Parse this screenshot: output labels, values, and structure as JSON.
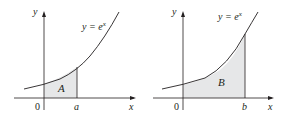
{
  "figures": [
    {
      "id": "left",
      "curve_label": "y = e",
      "curve_exponent": "x",
      "y_axis_label": "y",
      "x_axis_label": "x",
      "origin_label": "0",
      "bound_label": "a",
      "region_label": "A"
    },
    {
      "id": "right",
      "curve_label": "y = e",
      "curve_exponent": "x",
      "y_axis_label": "y",
      "x_axis_label": "x",
      "origin_label": "0",
      "bound_label": "b",
      "region_label": "B"
    }
  ],
  "colors": {
    "shade": "#e6e7e8",
    "ink": "#231f20"
  }
}
